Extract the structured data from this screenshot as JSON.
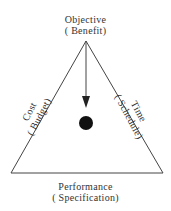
{
  "diagram": {
    "type": "project-management-triangle",
    "vertices": {
      "top": {
        "title": "Objective",
        "subtitle": "( Benefit)"
      }
    },
    "sides": {
      "left": {
        "title": "Cost",
        "subtitle": "( Budget)"
      },
      "right": {
        "title": "Time",
        "subtitle": "( Schedule)"
      },
      "bottom": {
        "title": "Performance",
        "subtitle": "( Specification)"
      }
    },
    "elements": {
      "arrow": "downward arrow from apex toward center",
      "center_marker": "filled black circle"
    },
    "colors": {
      "line": "#444444",
      "text": "#333333",
      "marker": "#111111",
      "background": "#ffffff"
    }
  }
}
